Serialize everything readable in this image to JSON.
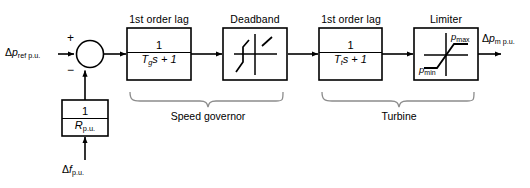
{
  "diagram": {
    "type": "control-block-diagram",
    "stroke_color": "#000000",
    "background_color": "#ffffff",
    "signals": {
      "input_reference": {
        "symbol": "Δp",
        "subscript": "ref p.u."
      },
      "output_mechanical": {
        "symbol": "Δp",
        "subscript": "m p.u."
      },
      "feedback_input": {
        "symbol": "Δf",
        "subscript": "p.u."
      }
    },
    "summing_junction": {
      "plus_sign": "+",
      "minus_sign": "−"
    },
    "blocks": [
      {
        "id": "governor-lag",
        "title": "1st order lag",
        "numerator": "1",
        "denominator_time_constant": "T",
        "denominator_subscript": "g",
        "denominator_rest": "s + 1"
      },
      {
        "id": "deadband",
        "title": "Deadband",
        "numerator": "",
        "denominator_time_constant": "",
        "denominator_subscript": "",
        "denominator_rest": ""
      },
      {
        "id": "turbine-lag",
        "title": "1st order lag",
        "numerator": "1",
        "denominator_time_constant": "T",
        "denominator_subscript": "t",
        "denominator_rest": "s + 1"
      },
      {
        "id": "limiter",
        "title": "Limiter",
        "numerator": "",
        "denominator_time_constant": "",
        "denominator_subscript": "",
        "denominator_rest": ""
      }
    ],
    "feedback_block": {
      "id": "droop-gain",
      "numerator": "1",
      "denominator_symbol": "R",
      "denominator_subscript": "p.u."
    },
    "limiter_labels": {
      "max": "p",
      "max_subscript": "max",
      "min": "p",
      "min_subscript": "min"
    },
    "braces": [
      {
        "id": "speed-governor-brace",
        "label": "Speed governor"
      },
      {
        "id": "turbine-brace",
        "label": "Turbine"
      }
    ]
  }
}
